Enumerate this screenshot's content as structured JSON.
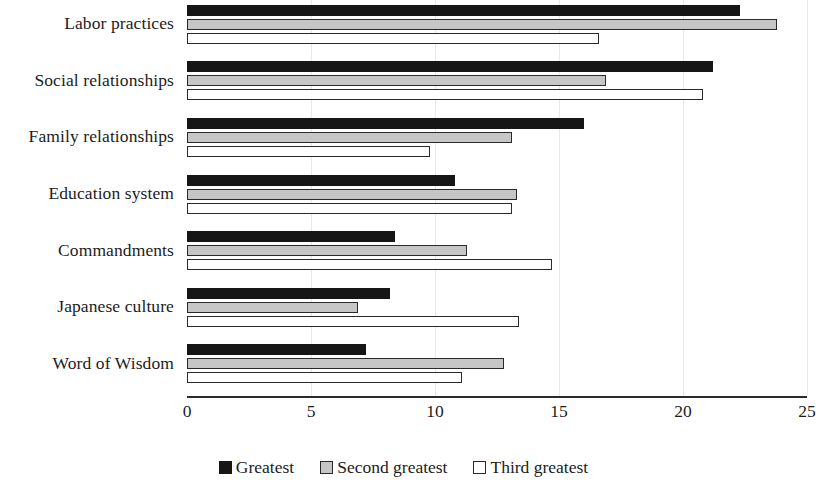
{
  "chart_data": {
    "type": "bar",
    "orientation": "horizontal",
    "title": "",
    "subtitle": "",
    "xlabel": "",
    "ylabel": "",
    "xlim": [
      0,
      25
    ],
    "xticks": [
      0,
      5,
      10,
      15,
      20,
      25
    ],
    "xtick_labels": [
      "0",
      "5",
      "10",
      "15",
      "20",
      "25"
    ],
    "grid": true,
    "grid_axis": "x",
    "legend_position": "bottom-center",
    "categories": [
      "Labor practices",
      "Social relationships",
      "Family relationships",
      "Education system",
      "Commandments",
      "Japanese culture",
      "Word of Wisdom"
    ],
    "series": [
      {
        "name": "Greatest",
        "color": "#161616",
        "values": [
          22.3,
          21.2,
          16.0,
          10.8,
          8.4,
          8.2,
          7.2
        ]
      },
      {
        "name": "Second greatest",
        "color": "#c6c6c6",
        "values": [
          23.8,
          16.9,
          13.1,
          13.3,
          11.3,
          6.9,
          12.8
        ]
      },
      {
        "name": "Third greatest",
        "color": "#ffffff",
        "values": [
          16.6,
          20.8,
          9.8,
          13.1,
          14.7,
          13.4,
          11.1
        ]
      }
    ]
  },
  "legend": {
    "items": [
      {
        "label": "Greatest",
        "style": "greatest"
      },
      {
        "label": "Second greatest",
        "style": "second"
      },
      {
        "label": "Third greatest",
        "style": "third"
      }
    ]
  },
  "colors": {
    "greatest": "#161616",
    "second_greatest": "#c6c6c6",
    "third_greatest": "#ffffff",
    "axis": "#2b2b2b",
    "grid": "#e9e9e9",
    "text": "#1c1c1c",
    "background": "#ffffff"
  }
}
